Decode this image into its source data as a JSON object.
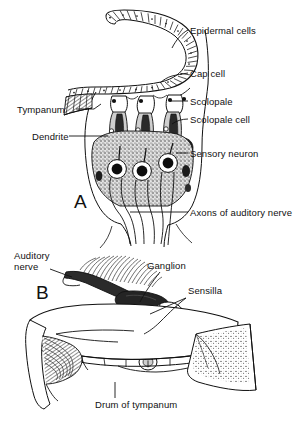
{
  "figure": {
    "background_color": "#ffffff",
    "ink_color": "#111111"
  },
  "panels": [
    {
      "id": "A",
      "letter": "A",
      "caption": "Longitudinal section through a scolopidial tympanal organ",
      "labels": [
        {
          "name": "epidermal-cells",
          "text": "Epidermal cells"
        },
        {
          "name": "cap-cell",
          "text": "Cap cell"
        },
        {
          "name": "scolopale",
          "text": "Scolopale"
        },
        {
          "name": "scolopale-cell",
          "text": "Scolopale cell"
        },
        {
          "name": "sensory-neuron",
          "text": "Sensory neuron"
        },
        {
          "name": "axons-of-auditory-nerve",
          "text": "Axons of auditory nerve"
        },
        {
          "name": "tympanum",
          "text": "Tympanum"
        },
        {
          "name": "dendrite",
          "text": "Dendrite"
        }
      ]
    },
    {
      "id": "B",
      "letter": "B",
      "caption": "Three dimensional view of the tympanum and attached ganglion",
      "labels": [
        {
          "name": "auditory-nerve",
          "text": "Auditory",
          "text2": "nerve"
        },
        {
          "name": "ganglion",
          "text": "Ganglion"
        },
        {
          "name": "sensilla",
          "text": "Sensilla"
        },
        {
          "name": "drum-of-tympanum",
          "text": "Drum of tympanum"
        }
      ]
    }
  ],
  "label_text": {
    "epidermal_cells": "Epidermal cells",
    "cap_cell": "Cap cell",
    "scolopale": "Scolopale",
    "scolopale_cell": "Scolopale cell",
    "sensory_neuron": "Sensory neuron",
    "axons_of_auditory_nerve": "Axons of auditory nerve",
    "tympanum": "Tympanum",
    "dendrite": "Dendrite",
    "auditory_nerve_line1": "Auditory",
    "auditory_nerve_line2": "nerve",
    "ganglion": "Ganglion",
    "sensilla": "Sensilla",
    "drum_of_tympanum": "Drum of tympanum",
    "panel_a_letter": "A",
    "panel_b_letter": "B"
  }
}
